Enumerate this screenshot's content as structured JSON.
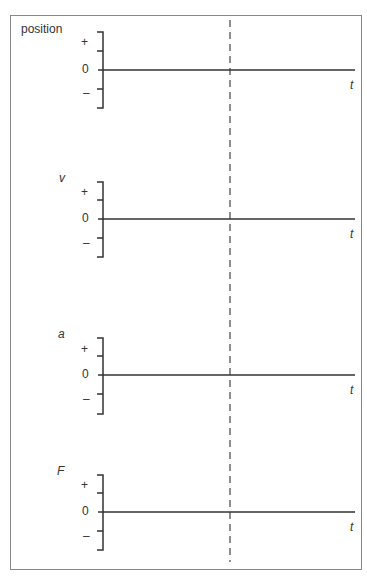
{
  "diagram": {
    "dashed_line_label": "",
    "panels": [
      {
        "name": "position",
        "label": "position",
        "italic": false,
        "plus": "+",
        "zero": "0",
        "minus": "–",
        "t_label": "t"
      },
      {
        "name": "velocity",
        "label": "v",
        "italic": true,
        "plus": "+",
        "zero": "0",
        "minus": "–",
        "t_label": "t"
      },
      {
        "name": "acceleration",
        "label": "a",
        "italic": true,
        "plus": "+",
        "zero": "0",
        "minus": "–",
        "t_label": "t"
      },
      {
        "name": "force",
        "label": "F",
        "italic": true,
        "plus": "+",
        "zero": "0",
        "minus": "–",
        "t_label": "t"
      }
    ]
  }
}
